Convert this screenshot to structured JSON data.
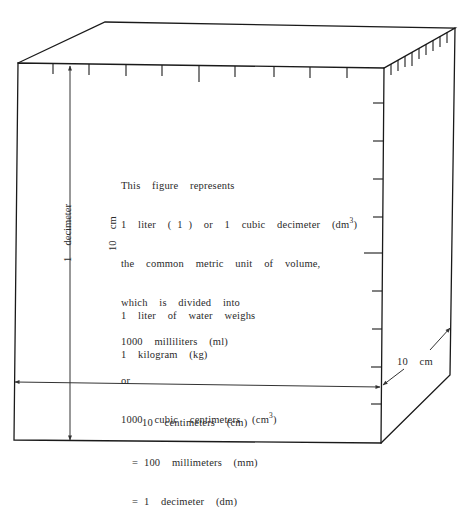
{
  "figure": {
    "type": "cube-diagram",
    "stroke_color": "#1a1a1a",
    "text_color": "#2a2a2a",
    "main_description": {
      "line1": "This  figure  represents",
      "line2_prefix": "1  liter  ( 1 )  or  1  cubic  decimeter  (dm",
      "line2_sup": "3",
      "line2_suffix": ")",
      "line3": "the  common  metric  unit  of  volume,",
      "line4": "which  is  divided  into",
      "line5": "1000  milliliters  (ml)",
      "line6": "or",
      "line7_prefix": "1000  cubic  centimeters  (cm",
      "line7_sup": "3",
      "line7_suffix": ")"
    },
    "water_note": {
      "line1": "1  liter  of  water  weighs",
      "line2": "1  kilogram  (kg)"
    },
    "width_label": {
      "line1": "10  centimeters  (cm)",
      "line2": "= 100  millimeters  (mm)",
      "line3": "= 1  decimeter  (dm)"
    },
    "height_label": {
      "line1": "1  decimeter",
      "line2": "10  cm"
    },
    "depth_label": "10  cm"
  }
}
